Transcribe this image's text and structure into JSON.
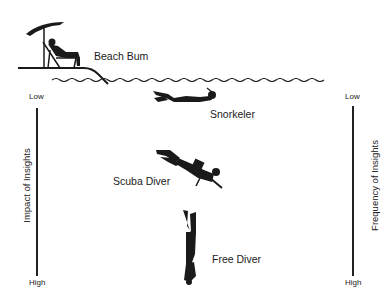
{
  "figures": [
    {
      "id": "beach-bum",
      "label": "Beach Bum"
    },
    {
      "id": "snorkeler",
      "label": "Snorkeler"
    },
    {
      "id": "scuba-diver",
      "label": "Scuba Diver"
    },
    {
      "id": "free-diver",
      "label": "Free Diver"
    }
  ],
  "left_axis": {
    "title": "Impact of Insights",
    "top": "Low",
    "bottom": "High"
  },
  "right_axis": {
    "title": "Frequency of Insights",
    "top": "Low",
    "bottom": "High"
  },
  "colors": {
    "ink": "#1a1a1a",
    "background": "#ffffff"
  }
}
